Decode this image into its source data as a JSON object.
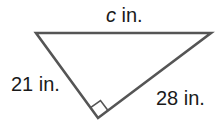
{
  "diagram": {
    "type": "right-triangle",
    "line_color": "#555555",
    "text_color": "#1a1a1a",
    "vertices": {
      "top_left": [
        36,
        33
      ],
      "top_right": [
        211,
        33
      ],
      "bottom": [
        98,
        118
      ]
    },
    "right_angle_at": "bottom",
    "labels": {
      "hypotenuse_var": "c",
      "hypotenuse_unit": " in.",
      "left_leg": "21 in.",
      "right_leg": "28 in."
    }
  }
}
